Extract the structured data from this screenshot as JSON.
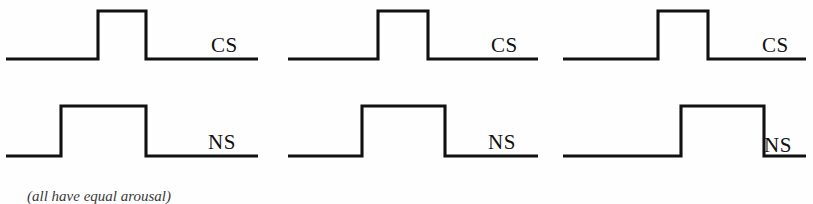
{
  "figure": {
    "title": "",
    "caption": "(all have equal arousal)",
    "stroke_color": "#111111",
    "background_color": "#ffffff",
    "label_cs": "CS",
    "label_ns": "NS"
  },
  "chart_data": {
    "type": "line",
    "title": "",
    "xlabel": "",
    "ylabel": "",
    "grid": false,
    "legend": "none",
    "panels": [
      {
        "name": "panel-1",
        "x_range": [
          6,
          258
        ],
        "series": [
          {
            "name": "CS",
            "label": "CS",
            "baseline_y": 59,
            "pulse_top_y": 11,
            "pulse_start_x": 98,
            "pulse_end_x": 146,
            "label_x": 211,
            "label_y": 52,
            "points": [
              [
                6,
                59
              ],
              [
                98,
                59
              ],
              [
                98,
                11
              ],
              [
                146,
                11
              ],
              [
                146,
                59
              ],
              [
                258,
                59
              ]
            ]
          },
          {
            "name": "NS",
            "label": "NS",
            "baseline_y": 156,
            "pulse_top_y": 106,
            "pulse_start_x": 61,
            "pulse_end_x": 146,
            "label_x": 208,
            "label_y": 149,
            "points": [
              [
                6,
                156
              ],
              [
                61,
                156
              ],
              [
                61,
                106
              ],
              [
                146,
                106
              ],
              [
                146,
                156
              ],
              [
                258,
                156
              ]
            ]
          }
        ]
      },
      {
        "name": "panel-2",
        "x_range": [
          288,
          538
        ],
        "series": [
          {
            "name": "CS",
            "label": "CS",
            "baseline_y": 59,
            "pulse_top_y": 11,
            "pulse_start_x": 378,
            "pulse_end_x": 428,
            "label_x": 491,
            "label_y": 52,
            "points": [
              [
                288,
                59
              ],
              [
                378,
                59
              ],
              [
                378,
                11
              ],
              [
                428,
                11
              ],
              [
                428,
                59
              ],
              [
                538,
                59
              ]
            ]
          },
          {
            "name": "NS",
            "label": "NS",
            "baseline_y": 156,
            "pulse_top_y": 106,
            "pulse_start_x": 362,
            "pulse_end_x": 445,
            "label_x": 488,
            "label_y": 149,
            "points": [
              [
                288,
                156
              ],
              [
                362,
                156
              ],
              [
                362,
                106
              ],
              [
                445,
                106
              ],
              [
                445,
                156
              ],
              [
                538,
                156
              ]
            ]
          }
        ]
      },
      {
        "name": "panel-3",
        "x_range": [
          563,
          806
        ],
        "series": [
          {
            "name": "CS",
            "label": "CS",
            "baseline_y": 59,
            "pulse_top_y": 11,
            "pulse_start_x": 658,
            "pulse_end_x": 708,
            "label_x": 762,
            "label_y": 52,
            "points": [
              [
                563,
                59
              ],
              [
                658,
                59
              ],
              [
                658,
                11
              ],
              [
                708,
                11
              ],
              [
                708,
                59
              ],
              [
                806,
                59
              ]
            ]
          },
          {
            "name": "NS",
            "label": "NS",
            "baseline_y": 156,
            "pulse_top_y": 106,
            "pulse_start_x": 681,
            "pulse_end_x": 764,
            "label_x": 764,
            "label_y": 152,
            "points": [
              [
                563,
                156
              ],
              [
                681,
                156
              ],
              [
                681,
                106
              ],
              [
                764,
                106
              ],
              [
                764,
                156
              ],
              [
                806,
                156
              ]
            ]
          }
        ]
      }
    ]
  }
}
